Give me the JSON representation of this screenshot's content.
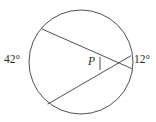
{
  "figure": {
    "type": "circle-geometry-diagram",
    "background_color": "#ffffff",
    "stroke_color": "#3c3c3c",
    "text_color": "#2b2b2b",
    "circle": {
      "center_x": 81,
      "center_y": 62,
      "radius": 52
    },
    "chords": [
      {
        "name": "upper-chord",
        "x1": 42,
        "y1": 29,
        "x2": 131.5,
        "y2": 68.5
      },
      {
        "name": "lower-chord",
        "x1": 48,
        "y1": 104,
        "x2": 130.5,
        "y2": 56
      }
    ],
    "intersection": {
      "name": "point-p",
      "x": 114,
      "y": 63
    },
    "angle_tick": {
      "x1": 100,
      "y1": 57,
      "x2": 100,
      "y2": 70
    },
    "labels": {
      "left_arc_angle": "42°",
      "right_arc_angle": "12°",
      "intersection_point": "P"
    }
  }
}
